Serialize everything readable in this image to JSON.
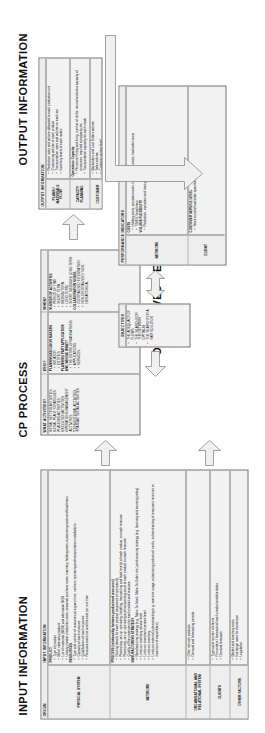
{
  "sections": {
    "input_title": "INPUT INFORMATION",
    "cp_title": "CP PROCESS",
    "objectives_title": "OBJECTIVES",
    "performance_title": "PERFORMANCE INDICATORS",
    "output_title": "OUTPUT INFORMATION"
  },
  "input_table": {
    "header": "INPUT INFORMATION",
    "origin_label": "ORIGIN",
    "rows": [
      {
        "label": "PHYSICAL SYSTEM",
        "groups": [
          {
            "subtitle": "PRODUCT",
            "items": [
              "Type of product",
              "Bill of materials products",
              "List of materials (BOM) and alternative BOM",
              "Unitary product production costs, seasonal purchase costs, inventory holding costs, outsourcing costs and lead times"
            ]
          },
          {
            "subtitle": "RESOURCES",
            "items": [
              "Type and number of resources at a given time, workers, operating and transportation installations",
              "Capacity of each resource",
              "Qualification of each resource",
              "Resource overtime and the cost per unit time"
            ]
          }
        ]
      },
      {
        "label": "NETWORK",
        "groups": [
          {
            "subtitle": "PROCESS (relationship between product and resources)",
            "items": [
              "Routing details for each product (sequence of operations)",
              "Processing, set-up, operating, handling, transporting and lead time(s) of each product, on each resource",
              "Processing, set-up, operating and transporting costs of each product on each resource",
              "Quality of the processes for each product and resource"
            ]
          },
          {
            "subtitle": "MANUFACTURING STRATEGY",
            "items": [
              "Manufacturing strategy (e.g. Make-To-Stock, Make-To-Order, etc.) and sourcing strategy (e.g. licensing and sourcing policy)",
              "Limits on inventory service level",
              "Limits on investment service level",
              "Limits on inventory",
              "Limits on external subcontracting (e.g. overtime usage, outsourcing policies of works, subcontracting of resources minimum or maximum of capabilities)"
            ]
          }
        ]
      },
      {
        "label": "ORGANISATIONAL AND RELATIONAL SYSTEM",
        "groups": [
          {
            "subtitle": "",
            "items": [
              "Other network products",
              "Demand and forecasting periods"
            ]
          }
        ]
      },
      {
        "label": "CLIENTS",
        "groups": [
          {
            "subtitle": "",
            "items": [
              "Types and number of clients",
              "Firm orders / forecasts of each product and due dates",
              "Demand forecasts"
            ]
          }
        ]
      },
      {
        "label": "OTHER FACTORS",
        "groups": [
          {
            "subtitle": "",
            "items": [
              "Market and inventory costs",
              "Exchange rates for conversion",
              "Legislation"
            ]
          }
        ]
      }
    ]
  },
  "cp_table": {
    "columns": [
      "WHAT ACTIVITIES?",
      "WHO?",
      "WHEN?"
    ],
    "what": [
      "INITIAL SETTING ACTIVITIES",
      "INITIAL PLANT STRATEGIES",
      "PLANNING ACTIVITIES",
      "EXECUTION ACTIVITIES",
      "OPERATIONS MANAGEMENT ACTIVITIES",
      "CONVENTIONAL ACTIVITIES",
      "TRANSACTIONAL ACTIVITIES"
    ],
    "who_groups": [
      {
        "subtitle": "PLANNING/DECISION MAKERS",
        "items": [
          "INITIATOR",
          "ENTITIES"
        ]
      },
      {
        "subtitle": "PLANNING PART APPLICATION",
        "items": []
      },
      {
        "subtitle": "AND WHOSE WHAT?",
        "items": [
          "THE ENTIRE ORGANISATIONS",
          "APPLICATIONS",
          "SERVICES"
        ]
      }
    ],
    "when_groups": [
      {
        "subtitle": "NUMBER OF ACTIVITIES",
        "items": [
          "PERIOD OF TIME",
          "SHORT TERM",
          "MEDIUM TERM",
          "LONG TERM",
          "SHORT, MEDIUM & LONG TERM"
        ]
      },
      {
        "subtitle": "COLLABORATION MODEL",
        "items": [
          "CENTRALISED INTEGRATION",
          "NON-CENTRALISED / NON-HIERARCHICAL"
        ]
      }
    ]
  },
  "objectives": {
    "header": "OBJECTIVES",
    "items": [
      "THE ADEQUACY OF FLOWS",
      "THE SEARCH FOR THE NETWORK OPTIMUM",
      "THE SEARCH FOR A FAIR SOLUTION"
    ]
  },
  "performance_table": {
    "header": "PERFORMANCE INDICATORS",
    "rows": [
      {
        "label": "NETWORK",
        "groups": [
          {
            "subtitle": "COSTS",
            "items": [
              "Holding costs, operation costs, transportation costs, backorder costs",
              "TIMES / lead times"
            ]
          },
          {
            "subtitle": "VOLUME FLEXIBILITY",
            "items": [
              "Production, operation and transport times"
            ]
          }
        ]
      },
      {
        "label": "CLIENT",
        "groups": [
          {
            "subtitle": "CUSTOMER SERVICE LEVEL",
            "items": [
              "Stock-out and backorder quantities"
            ]
          }
        ]
      }
    ]
  },
  "output_table": {
    "header": "OUTPUT INFORMATION",
    "rows": [
      {
        "label": "PLANS / MATERIALS FLOW",
        "groups": [
          {
            "subtitle": "",
            "items": [
              "Production rates and volume allocated to each production unit",
              "Outsourcing volume of each product",
              "Transportation rates and volume on each arc",
              "Inventory levels of each nodes"
            ]
          }
        ]
      },
      {
        "label": "CAPACITY PLANNING",
        "groups": [
          {
            "subtitle": "Operations Capacity",
            "items": [
              "Personnel hiring and firing, number of shifts, normal and extra capacity of resources, required at capacity etc.",
              "Transportation capacity for each mode"
            ]
          }
        ]
      },
      {
        "label": "CUSTOMER",
        "groups": [
          {
            "subtitle": "",
            "items": [
              "Backorders and Lost Orders volume",
              "Sales volume",
              "Customer service level"
            ]
          }
        ]
      }
    ]
  }
}
